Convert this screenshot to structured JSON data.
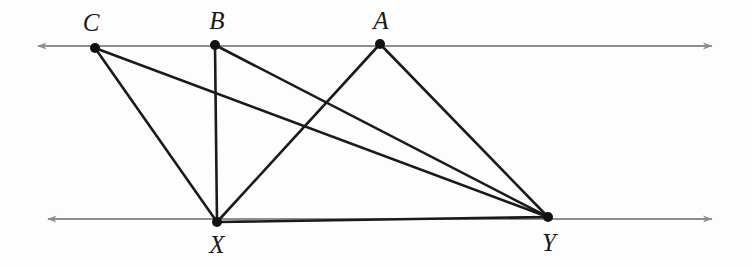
{
  "figure": {
    "kind": "geometry-diagram",
    "width": 753,
    "height": 268,
    "background_color": "#fdfdfd"
  },
  "colors": {
    "parallel_line": "#8f8f8f",
    "segment": "#1a1a1a",
    "point": "#111111",
    "label": "#1a1a1a"
  },
  "parallel_lines": [
    {
      "id": "upper-line",
      "name": "upper-parallel-line",
      "y": 46,
      "x_start": 38,
      "x_end": 712,
      "arrow_start": true,
      "arrow_end": true,
      "color": "#8f8f8f"
    },
    {
      "id": "lower-line",
      "name": "lower-parallel-line",
      "y": 219,
      "x_start": 48,
      "x_end": 712,
      "arrow_start": true,
      "arrow_end": true,
      "color": "#8f8f8f"
    }
  ],
  "points": [
    {
      "id": "C",
      "label": "C",
      "x": 95,
      "y": 48,
      "label_x": 91,
      "label_y": 22,
      "on_line": "upper-line"
    },
    {
      "id": "B",
      "label": "B",
      "x": 215,
      "y": 45,
      "label_x": 217,
      "label_y": 20,
      "on_line": "upper-line"
    },
    {
      "id": "A",
      "label": "A",
      "x": 380,
      "y": 44,
      "label_x": 381,
      "label_y": 20,
      "on_line": "upper-line"
    },
    {
      "id": "X",
      "label": "X",
      "x": 217,
      "y": 222,
      "label_x": 217,
      "label_y": 244,
      "on_line": "lower-line"
    },
    {
      "id": "Y",
      "label": "Y",
      "x": 548,
      "y": 217,
      "label_x": 549,
      "label_y": 242,
      "on_line": "lower-line"
    }
  ],
  "segments": [
    {
      "id": "CX",
      "name": "segment-c-x",
      "from": "C",
      "to": "X",
      "x1": 95,
      "y1": 48,
      "x2": 217,
      "y2": 222
    },
    {
      "id": "CY",
      "name": "segment-c-y",
      "from": "C",
      "to": "Y",
      "x1": 95,
      "y1": 48,
      "x2": 548,
      "y2": 217
    },
    {
      "id": "BX",
      "name": "segment-b-x",
      "from": "B",
      "to": "X",
      "x1": 215,
      "y1": 45,
      "x2": 217,
      "y2": 222
    },
    {
      "id": "BY",
      "name": "segment-b-y",
      "from": "B",
      "to": "Y",
      "x1": 215,
      "y1": 45,
      "x2": 548,
      "y2": 217
    },
    {
      "id": "AX",
      "name": "segment-a-x",
      "from": "A",
      "to": "X",
      "x1": 380,
      "y1": 44,
      "x2": 217,
      "y2": 222
    },
    {
      "id": "AY",
      "name": "segment-a-y",
      "from": "A",
      "to": "Y",
      "x1": 380,
      "y1": 44,
      "x2": 548,
      "y2": 217
    },
    {
      "id": "XY",
      "name": "segment-x-y",
      "from": "X",
      "to": "Y",
      "x1": 217,
      "y1": 222,
      "x2": 548,
      "y2": 217
    }
  ]
}
